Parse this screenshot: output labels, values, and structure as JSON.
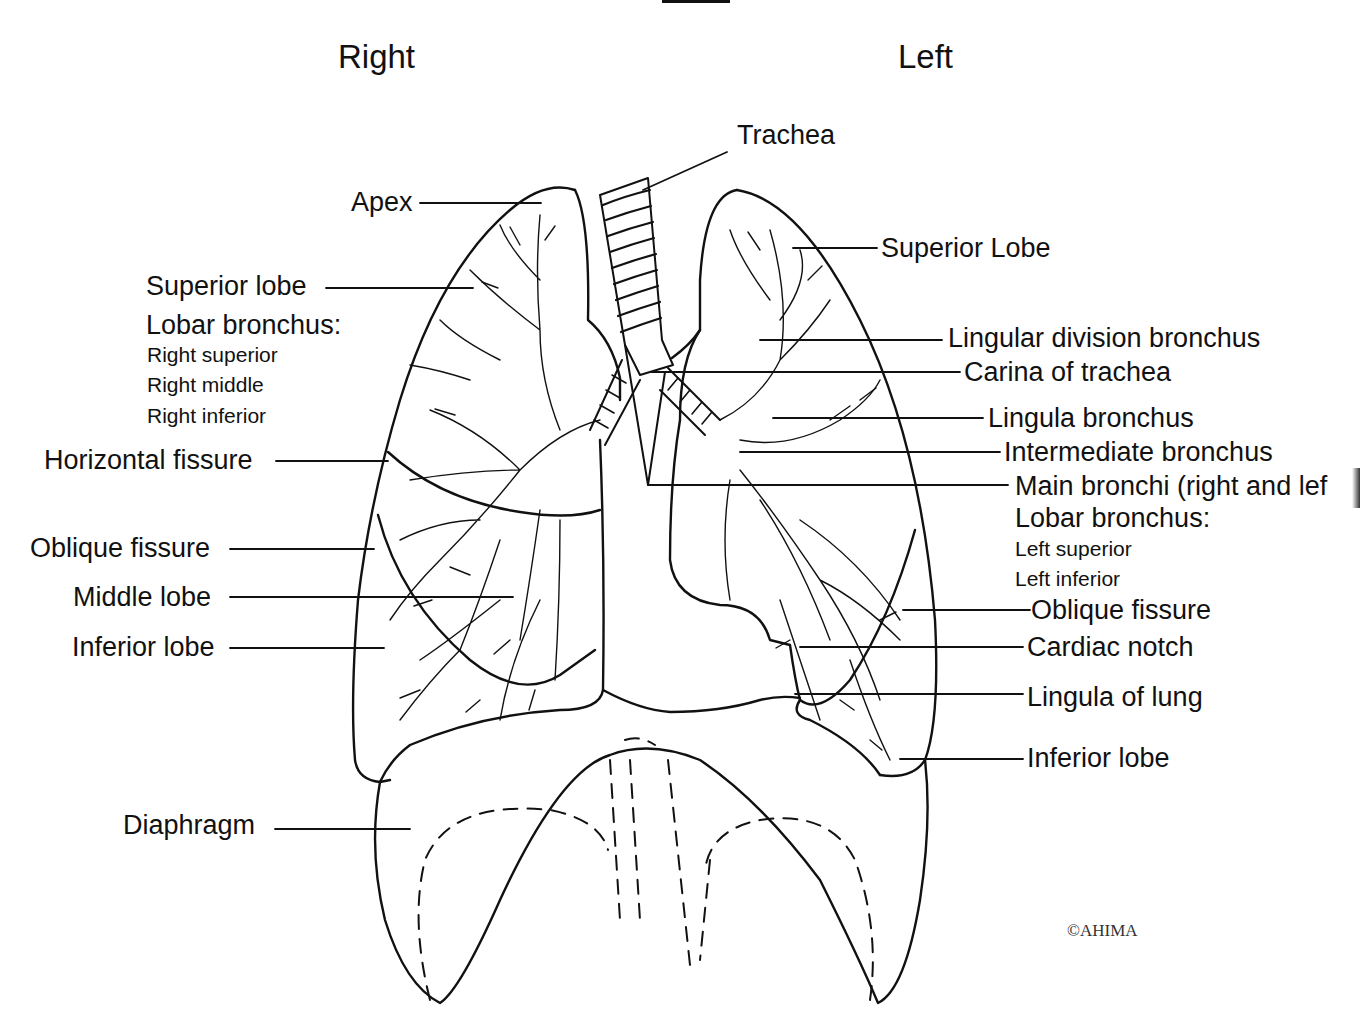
{
  "headings": {
    "right": "Right",
    "left": "Left"
  },
  "labels": {
    "trachea": "Trachea",
    "apex": "Apex",
    "right_superior_lobe": "Superior lobe",
    "right_lobar_bronchus": "Lobar bronchus:",
    "right_superior": "Right superior",
    "right_middle": "Right middle",
    "right_inferior": "Right inferior",
    "horizontal_fissure": "Horizontal fissure",
    "right_oblique_fissure": "Oblique fissure",
    "middle_lobe": "Middle lobe",
    "right_inferior_lobe": "Inferior lobe",
    "diaphragm": "Diaphragm",
    "left_superior_lobe": "Superior Lobe",
    "lingular_division_bronchus": "Lingular division bronchus",
    "carina": "Carina of trachea",
    "lingula_bronchus": "Lingula bronchus",
    "intermediate_bronchus": "Intermediate bronchus",
    "main_bronchi": "Main bronchi (right and lef",
    "left_lobar_bronchus": "Lobar bronchus:",
    "left_superior": "Left superior",
    "left_inferior": "Left inferior",
    "left_oblique_fissure": "Oblique fissure",
    "cardiac_notch": "Cardiac notch",
    "lingula_of_lung": "Lingula of lung",
    "left_inferior_lobe": "Inferior lobe"
  },
  "copyright": "©AHIMA",
  "colors": {
    "line": "#111111",
    "background": "#ffffff"
  }
}
